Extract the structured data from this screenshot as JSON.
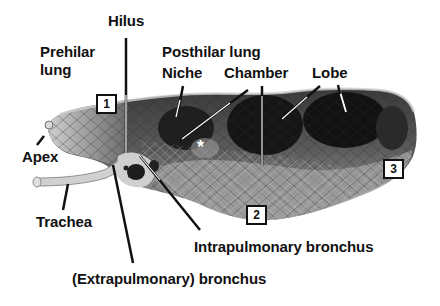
{
  "figure": {
    "labels": {
      "hilus": "Hilus",
      "prehilar_lung_line1": "Prehilar",
      "prehilar_lung_line2": "lung",
      "posthilar_lung": "Posthilar lung",
      "niche": "Niche",
      "chamber": "Chamber",
      "lobe": "Lobe",
      "apex": "Apex",
      "trachea": "Trachea",
      "intrapulmonary_bronchus": "Intrapulmonary bronchus",
      "extrapulmonary_bronchus": "(Extrapulmonary) bronchus"
    },
    "markers": {
      "region_1": "1",
      "region_2": "2",
      "region_3": "3",
      "asterisk": "*"
    },
    "colors": {
      "background": "#ffffff",
      "text": "#111111",
      "tissue_dark": "#1a1a1a",
      "tissue_mid": "#6e6e6e",
      "tissue_light": "#b8b8b8"
    }
  }
}
